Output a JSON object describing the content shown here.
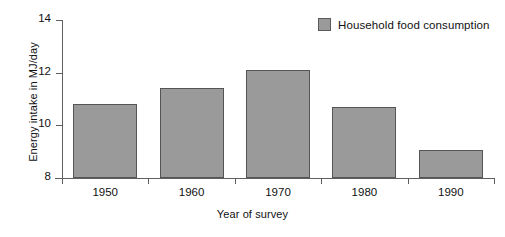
{
  "chart_data": {
    "type": "bar",
    "title": "",
    "subtitle": "",
    "categories": [
      "1950",
      "1960",
      "1970",
      "1980",
      "1990"
    ],
    "values": [
      10.8,
      11.4,
      12.1,
      10.7,
      9.05
    ],
    "series": [
      {
        "name": "Household food consumption",
        "values": [
          10.8,
          11.4,
          12.1,
          10.7,
          9.05
        ],
        "color": "#9a9a9a"
      }
    ],
    "xlabel": "Year of survey",
    "ylabel": "Energy intake in MJ/day",
    "ylim": [
      8,
      14
    ],
    "yticks": [
      8,
      10,
      12,
      14
    ],
    "ytick_labels": [
      "8",
      "10",
      "12",
      "14"
    ],
    "xtick_labels": [
      "1950",
      "1960",
      "1970",
      "1980",
      "1990"
    ],
    "grid": false,
    "legend_position": "top-right",
    "bar_color": "#9a9a9a",
    "bar_edge_color": "#555555",
    "axis_color": "#5f5f5f"
  },
  "legend": {
    "entries": [
      {
        "label": "Household food consumption",
        "color": "#9a9a9a"
      }
    ]
  }
}
